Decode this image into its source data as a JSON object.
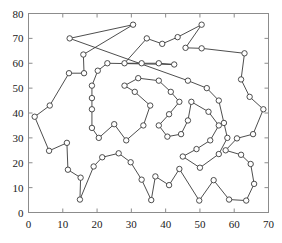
{
  "chart_data": {
    "type": "line",
    "title": "",
    "xlabel": "",
    "ylabel": "",
    "xlim": [
      0,
      70
    ],
    "ylim": [
      0,
      80
    ],
    "xticks": [
      0,
      10,
      20,
      30,
      40,
      50,
      60,
      70
    ],
    "yticks": [
      0,
      10,
      20,
      30,
      40,
      50,
      60,
      70,
      80
    ],
    "grid": false,
    "legend": "none",
    "marker": "circle-open",
    "line_color": "#3a3a3a",
    "marker_color": "#3a3a3a",
    "closed_tour": true,
    "series": [
      {
        "name": "tour",
        "points": [
          [
            12.0,
            70.0
          ],
          [
            30.5,
            75.5
          ],
          [
            16.0,
            63.5
          ],
          [
            16.2,
            56.0
          ],
          [
            11.8,
            56.0
          ],
          [
            6.2,
            43.0
          ],
          [
            1.8,
            38.5
          ],
          [
            6.0,
            24.8
          ],
          [
            11.2,
            28.0
          ],
          [
            11.5,
            17.2
          ],
          [
            15.2,
            14.0
          ],
          [
            15.0,
            5.2
          ],
          [
            19.0,
            18.5
          ],
          [
            21.5,
            22.2
          ],
          [
            26.3,
            23.8
          ],
          [
            29.8,
            20.2
          ],
          [
            33.0,
            13.2
          ],
          [
            35.8,
            5.0
          ],
          [
            37.0,
            14.5
          ],
          [
            41.0,
            11.0
          ],
          [
            44.0,
            17.5
          ],
          [
            49.8,
            4.8
          ],
          [
            54.0,
            13.0
          ],
          [
            58.5,
            5.2
          ],
          [
            63.5,
            4.8
          ],
          [
            65.8,
            11.5
          ],
          [
            64.8,
            19.5
          ],
          [
            62.0,
            23.2
          ],
          [
            57.5,
            25.0
          ],
          [
            60.8,
            29.8
          ],
          [
            65.5,
            31.5
          ],
          [
            68.5,
            41.5
          ],
          [
            64.5,
            46.5
          ],
          [
            62.0,
            53.5
          ],
          [
            63.0,
            64.0
          ],
          [
            50.5,
            66.0
          ],
          [
            45.8,
            66.2
          ],
          [
            50.5,
            75.5
          ],
          [
            43.5,
            70.5
          ],
          [
            39.0,
            67.8
          ],
          [
            34.5,
            70.0
          ],
          [
            28.0,
            60.0
          ],
          [
            33.0,
            60.0
          ],
          [
            38.0,
            60.0
          ],
          [
            42.5,
            59.5
          ],
          [
            23.0,
            60.0
          ],
          [
            20.2,
            57.0
          ],
          [
            18.5,
            51.0
          ],
          [
            18.5,
            46.0
          ],
          [
            18.5,
            41.5
          ],
          [
            18.5,
            34.0
          ],
          [
            20.5,
            30.0
          ],
          [
            25.0,
            35.5
          ],
          [
            28.5,
            29.0
          ],
          [
            33.5,
            35.0
          ],
          [
            35.5,
            43.0
          ],
          [
            31.0,
            48.5
          ],
          [
            28.0,
            51.0
          ],
          [
            32.0,
            54.0
          ],
          [
            38.0,
            53.0
          ],
          [
            41.5,
            48.5
          ],
          [
            44.0,
            44.5
          ],
          [
            41.0,
            39.5
          ],
          [
            38.0,
            35.0
          ],
          [
            40.5,
            30.5
          ],
          [
            44.5,
            31.5
          ],
          [
            46.5,
            37.0
          ],
          [
            47.5,
            44.5
          ],
          [
            52.5,
            40.5
          ],
          [
            55.5,
            35.0
          ],
          [
            53.0,
            29.0
          ],
          [
            49.0,
            25.5
          ],
          [
            45.0,
            22.5
          ],
          [
            50.0,
            18.0
          ],
          [
            55.5,
            23.5
          ],
          [
            58.0,
            30.0
          ],
          [
            57.0,
            36.0
          ],
          [
            55.5,
            45.0
          ],
          [
            52.0,
            50.0
          ],
          [
            46.5,
            53.0
          ]
        ]
      }
    ]
  },
  "axes": {
    "x_tick_labels": [
      "0",
      "10",
      "20",
      "30",
      "40",
      "50",
      "60",
      "70"
    ],
    "y_tick_labels": [
      "0",
      "10",
      "20",
      "30",
      "40",
      "50",
      "60",
      "70",
      "80"
    ]
  }
}
